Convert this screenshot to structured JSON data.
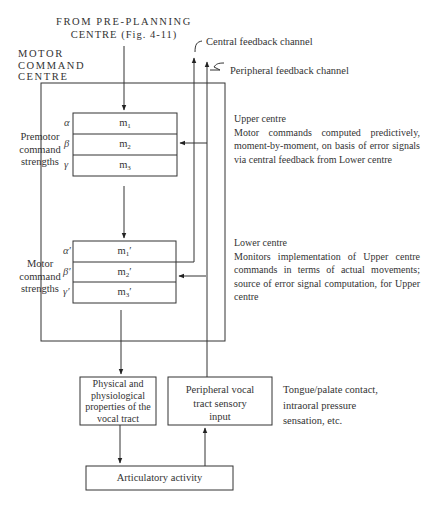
{
  "diagram": {
    "top_input": {
      "line1": "FROM PRE-PLANNING",
      "line2": "CENTRE (Fig. 4-11)"
    },
    "motor_command_centre": {
      "line1": "MOTOR",
      "line2": "COMMAND",
      "line3": "CENTRE"
    },
    "feedback": {
      "central": "Central feedback channel",
      "peripheral": "Peripheral feedback channel"
    },
    "premotor": {
      "label_line1": "Premotor",
      "label_line2": "command",
      "label_line3": "strengths",
      "rows": [
        {
          "greek": "α",
          "cell": "m",
          "sub": "1",
          "prime": ""
        },
        {
          "greek": "β",
          "cell": "m",
          "sub": "2",
          "prime": ""
        },
        {
          "greek": "γ",
          "cell": "m",
          "sub": "3",
          "prime": ""
        }
      ]
    },
    "motor": {
      "label_line1": "Motor",
      "label_line2": "command",
      "label_line3": "strengths",
      "rows": [
        {
          "greek": "α′",
          "cell": "m",
          "sub": "1",
          "prime": "′"
        },
        {
          "greek": "β′",
          "cell": "m",
          "sub": "2",
          "prime": "′"
        },
        {
          "greek": "γ′",
          "cell": "m",
          "sub": "3",
          "prime": "′"
        }
      ]
    },
    "upper_centre": {
      "heading": "Upper centre",
      "text": "Motor commands computed predictively, moment-by-moment, on basis of error signals via central feedback from Lower centre"
    },
    "lower_centre": {
      "heading": "Lower centre",
      "text": "Monitors implementation of Upper centre commands in terms of actual movements; source of error signal computation, for Upper centre"
    },
    "physical_box": {
      "line1": "Physical and",
      "line2": "physiological",
      "line3": "properties of the",
      "line4": "vocal tract"
    },
    "sensory_box": {
      "line1": "Peripheral vocal",
      "line2": "tract sensory",
      "line3": "input"
    },
    "sensory_note": {
      "line1": "Tongue/palate contact,",
      "line2": "intraoral pressure",
      "line3": "sensation, etc."
    },
    "articulatory_box": {
      "label": "Articulatory activity"
    }
  }
}
